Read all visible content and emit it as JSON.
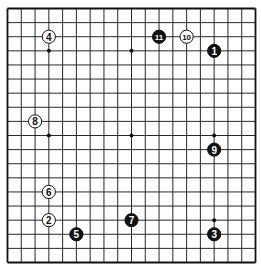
{
  "diagram": {
    "type": "go-board",
    "board_size": 19,
    "colors": {
      "background": "#ffffff",
      "line": "#111111",
      "black_stone": "#111111",
      "white_stone": "#ffffff",
      "star_point": "#111111"
    },
    "star_points": [
      [
        3,
        3
      ],
      [
        9,
        3
      ],
      [
        15,
        3
      ],
      [
        3,
        9
      ],
      [
        9,
        9
      ],
      [
        15,
        9
      ],
      [
        3,
        15
      ],
      [
        9,
        15
      ],
      [
        15,
        15
      ]
    ],
    "stones": [
      {
        "move": "1",
        "color": "black",
        "col": 15,
        "row": 3
      },
      {
        "move": "2",
        "color": "white",
        "col": 3,
        "row": 15
      },
      {
        "move": "3",
        "color": "black",
        "col": 15,
        "row": 16
      },
      {
        "move": "4",
        "color": "white",
        "col": 3,
        "row": 2
      },
      {
        "move": "5",
        "color": "black",
        "col": 5,
        "row": 16
      },
      {
        "move": "6",
        "color": "white",
        "col": 3,
        "row": 13
      },
      {
        "move": "7",
        "color": "black",
        "col": 9,
        "row": 15
      },
      {
        "move": "8",
        "color": "white",
        "col": 2,
        "row": 8
      },
      {
        "move": "9",
        "color": "black",
        "col": 15,
        "row": 10
      },
      {
        "move": "10",
        "color": "white",
        "col": 13,
        "row": 2
      },
      {
        "move": "11",
        "color": "black",
        "col": 11,
        "row": 2
      }
    ]
  }
}
